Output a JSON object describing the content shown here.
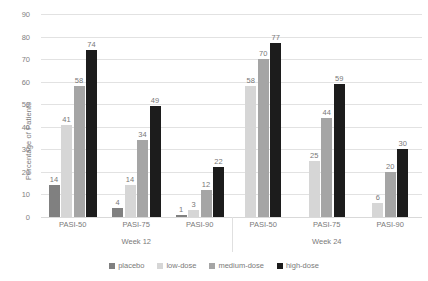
{
  "chart_data": {
    "type": "bar",
    "title": "",
    "xlabel": "",
    "ylabel": "Percentage of Patients",
    "ylim": [
      0,
      90
    ],
    "ytick_step": 10,
    "yticks": [
      90,
      80,
      70,
      60,
      50,
      40,
      30,
      20,
      10,
      0
    ],
    "grid": true,
    "legend_position": "bottom",
    "categories": [
      "PASI-50",
      "PASI-75",
      "PASI-90",
      "PASI-50",
      "PASI-75",
      "PASI-90"
    ],
    "group_labels": [
      "Week 12",
      "Week 24"
    ],
    "groups": [
      {
        "period": "Week 12",
        "categories": [
          {
            "label": "PASI-50",
            "values": {
              "placebo": 14,
              "low-dose": 41,
              "medium-dose": 58,
              "high-dose": 74
            }
          },
          {
            "label": "PASI-75",
            "values": {
              "placebo": 4,
              "low-dose": 14,
              "medium-dose": 34,
              "high-dose": 49
            }
          },
          {
            "label": "PASI-90",
            "values": {
              "placebo": 1,
              "low-dose": 3,
              "medium-dose": 12,
              "high-dose": 22
            }
          }
        ]
      },
      {
        "period": "Week 24",
        "categories": [
          {
            "label": "PASI-50",
            "values": {
              "placebo": null,
              "low-dose": 58,
              "medium-dose": 70,
              "high-dose": 77
            }
          },
          {
            "label": "PASI-75",
            "values": {
              "placebo": null,
              "low-dose": 25,
              "medium-dose": 44,
              "high-dose": 59
            }
          },
          {
            "label": "PASI-90",
            "values": {
              "placebo": null,
              "low-dose": 6,
              "medium-dose": 20,
              "high-dose": 30
            }
          }
        ]
      }
    ],
    "series": [
      {
        "name": "placebo",
        "color": "#808080",
        "values": [
          14,
          4,
          1,
          null,
          null,
          null
        ]
      },
      {
        "name": "low-dose",
        "color": "#d6d6d6",
        "values": [
          41,
          14,
          3,
          58,
          25,
          6
        ]
      },
      {
        "name": "medium-dose",
        "color": "#a5a5a5",
        "values": [
          58,
          34,
          12,
          70,
          44,
          20
        ]
      },
      {
        "name": "high-dose",
        "color": "#1c1c1c",
        "values": [
          74,
          49,
          22,
          77,
          59,
          30
        ]
      }
    ]
  },
  "legend": {
    "items": [
      {
        "label": "placebo",
        "color": "#808080"
      },
      {
        "label": "low-dose",
        "color": "#d6d6d6"
      },
      {
        "label": "medium-dose",
        "color": "#a5a5a5"
      },
      {
        "label": "high-dose",
        "color": "#1c1c1c"
      }
    ]
  }
}
